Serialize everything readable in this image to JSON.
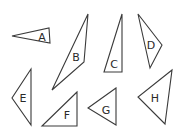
{
  "diagram": {
    "stroke_color": "#3a3a3a",
    "background": "#ffffff",
    "shapes": [
      {
        "label": "A",
        "points": "12,36 49,28 50,43",
        "label_pos": [
          42,
          37
        ]
      },
      {
        "label": "B",
        "points": "88,14 84,62 52,90",
        "label_pos": [
          76,
          57
        ]
      },
      {
        "label": "C",
        "points": "122,14 104,72 122,72",
        "label_pos": [
          114,
          64
        ]
      },
      {
        "label": "D",
        "points": "138,14 162,45 150,68",
        "label_pos": [
          151,
          45
        ]
      },
      {
        "label": "E",
        "points": "31,69 12,98 31,125",
        "label_pos": [
          23,
          98
        ]
      },
      {
        "label": "F",
        "points": "77,92 42,126 77,126",
        "label_pos": [
          67,
          115
        ]
      },
      {
        "label": "G",
        "points": "116,88 88,108 116,125",
        "label_pos": [
          106,
          110
        ]
      },
      {
        "label": "H",
        "points": "172,70 138,97 165,124",
        "label_pos": [
          155,
          98
        ]
      }
    ]
  }
}
